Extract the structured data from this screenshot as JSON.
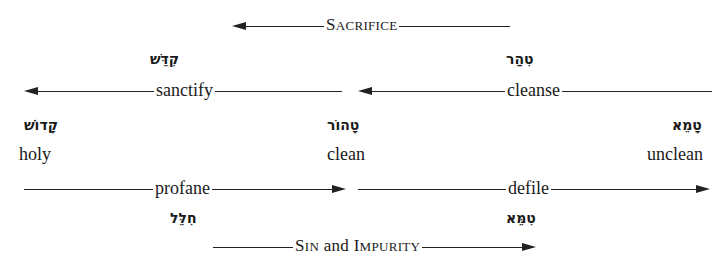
{
  "top_arrow": {
    "label_first": "S",
    "label_rest": "ACRIFICE",
    "direction": "left"
  },
  "bottom_arrow": {
    "label_s": "S",
    "label_in": "IN",
    "label_and": " and ",
    "label_i": "I",
    "label_mpurity": "MPURITY",
    "direction": "right"
  },
  "states": [
    {
      "hebrew": "קָדוֹשׁ",
      "english": "holy"
    },
    {
      "hebrew": "טָהוֹר",
      "english": "clean"
    },
    {
      "hebrew": "טָמֵא",
      "english": "unclean"
    }
  ],
  "upper_processes": [
    {
      "hebrew": "קִדֵּשׁ",
      "english": "sanctify",
      "direction": "left"
    },
    {
      "hebrew": "טִהַר",
      "english": "cleanse",
      "direction": "left"
    }
  ],
  "lower_processes": [
    {
      "english": "profane",
      "hebrew": "חִלֵּל",
      "direction": "right"
    },
    {
      "english": "defile",
      "hebrew": "טִמֵּא",
      "direction": "right"
    }
  ]
}
